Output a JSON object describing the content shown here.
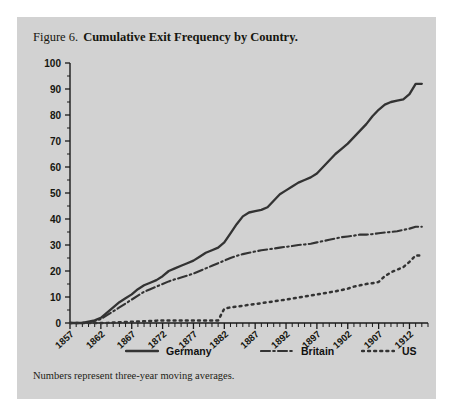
{
  "figure": {
    "number": "Figure 6.",
    "title": "Cumulative Exit Frequency by Country.",
    "note": "Numbers represent three-year moving averages."
  },
  "colors": {
    "panel_background": "#d2d2d2",
    "page_background": "#ffffff",
    "line": "#333333",
    "axis": "#1a1a1a",
    "text": "#16160f"
  },
  "legend": [
    {
      "label": "Germany",
      "style": "solid"
    },
    {
      "label": "Britain",
      "style": "dash-dot"
    },
    {
      "label": "US",
      "style": "dotted"
    }
  ],
  "chart_data": {
    "type": "line",
    "title": "Cumulative Exit Frequency by Country.",
    "subtitle": "Numbers represent three-year moving averages.",
    "xlabel": "",
    "ylabel": "",
    "xlim": [
      1857,
      1915
    ],
    "ylim": [
      0,
      100
    ],
    "ytick_step": 10,
    "yticks": [
      0,
      10,
      20,
      30,
      40,
      50,
      60,
      70,
      80,
      90,
      100
    ],
    "ytick_labels": [
      "0",
      "10",
      "20",
      "30",
      "40",
      "50",
      "60",
      "70",
      "80",
      "90",
      "100"
    ],
    "xticks": [
      1857,
      1862,
      1867,
      1872,
      1877,
      1882,
      1887,
      1892,
      1897,
      1902,
      1907,
      1912
    ],
    "xtick_labels": [
      "1857",
      "1862",
      "1867",
      "1872",
      "1877",
      "1882",
      "1887",
      "1892",
      "1897",
      "1902",
      "1907",
      "1912"
    ],
    "minor_xtick_interval": 1,
    "minor_ytick_interval": 5,
    "grid": false,
    "legend_position": "below",
    "series": [
      {
        "name": "Germany",
        "style": "solid",
        "x": [
          1857,
          1858,
          1859,
          1860,
          1861,
          1862,
          1863,
          1864,
          1865,
          1866,
          1867,
          1868,
          1869,
          1870,
          1871,
          1872,
          1873,
          1874,
          1875,
          1876,
          1877,
          1878,
          1879,
          1880,
          1881,
          1882,
          1883,
          1884,
          1885,
          1886,
          1887,
          1888,
          1889,
          1890,
          1891,
          1892,
          1893,
          1894,
          1895,
          1896,
          1897,
          1898,
          1899,
          1900,
          1901,
          1902,
          1903,
          1904,
          1905,
          1906,
          1907,
          1908,
          1909,
          1910,
          1911,
          1912,
          1913,
          1914
        ],
        "values": [
          0,
          0,
          0,
          0.5,
          1,
          2,
          4,
          6,
          8,
          9.5,
          11,
          13,
          14.5,
          15.5,
          16.5,
          18,
          20,
          21,
          22,
          23,
          24,
          25.5,
          27,
          28,
          29,
          31,
          34.5,
          38,
          41,
          42.5,
          43,
          43.5,
          44.5,
          47,
          49.5,
          51,
          52.5,
          54,
          55,
          56,
          57.5,
          60,
          62.5,
          65,
          67,
          69,
          71.5,
          74,
          76.5,
          79.5,
          82,
          84,
          85,
          85.5,
          86,
          88,
          92,
          92
        ]
      },
      {
        "name": "Britain",
        "style": "dash-dot",
        "x": [
          1857,
          1858,
          1859,
          1860,
          1861,
          1862,
          1863,
          1864,
          1865,
          1866,
          1867,
          1868,
          1869,
          1870,
          1871,
          1872,
          1873,
          1874,
          1875,
          1876,
          1877,
          1878,
          1879,
          1880,
          1881,
          1882,
          1883,
          1884,
          1885,
          1886,
          1887,
          1888,
          1889,
          1890,
          1891,
          1892,
          1893,
          1894,
          1895,
          1896,
          1897,
          1898,
          1899,
          1900,
          1901,
          1902,
          1903,
          1904,
          1905,
          1906,
          1907,
          1908,
          1909,
          1910,
          1911,
          1912,
          1913,
          1914
        ],
        "values": [
          0,
          0,
          0,
          0.3,
          0.8,
          1.5,
          3,
          4.5,
          6,
          7.5,
          9,
          10.5,
          12,
          13,
          14,
          15,
          16,
          16.8,
          17.5,
          18.2,
          19,
          20,
          21,
          22,
          23,
          24,
          25,
          25.8,
          26.5,
          27,
          27.5,
          28,
          28.3,
          28.6,
          29,
          29.3,
          29.6,
          30,
          30.2,
          30.5,
          31,
          31.5,
          32,
          32.5,
          33,
          33.3,
          33.6,
          34,
          34,
          34.2,
          34.5,
          34.8,
          35,
          35.3,
          35.8,
          36.3,
          37,
          37
        ]
      },
      {
        "name": "US",
        "style": "dotted",
        "x": [
          1857,
          1858,
          1859,
          1860,
          1861,
          1862,
          1863,
          1864,
          1865,
          1866,
          1867,
          1868,
          1869,
          1870,
          1871,
          1872,
          1873,
          1874,
          1875,
          1876,
          1877,
          1878,
          1879,
          1880,
          1881,
          1882,
          1883,
          1884,
          1885,
          1886,
          1887,
          1888,
          1889,
          1890,
          1891,
          1892,
          1893,
          1894,
          1895,
          1896,
          1897,
          1898,
          1899,
          1900,
          1901,
          1902,
          1903,
          1904,
          1905,
          1906,
          1907,
          1908,
          1909,
          1910,
          1911,
          1912,
          1913,
          1914
        ],
        "values": [
          0,
          0,
          0,
          0,
          0,
          0,
          0,
          0.2,
          0.3,
          0.4,
          0.5,
          0.6,
          0.7,
          0.8,
          0.9,
          1,
          1,
          1,
          1,
          1,
          1,
          1,
          1,
          1,
          1,
          5.5,
          6,
          6.3,
          6.6,
          7,
          7.3,
          7.6,
          8,
          8.3,
          8.7,
          9,
          9.4,
          9.8,
          10.2,
          10.6,
          11,
          11.4,
          11.8,
          12.2,
          12.7,
          13.2,
          14,
          14.5,
          15,
          15.3,
          15.8,
          18,
          19.5,
          20.5,
          21.5,
          23.5,
          26,
          26
        ]
      }
    ]
  }
}
